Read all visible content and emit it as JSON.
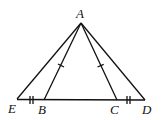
{
  "diagram": {
    "type": "geometry",
    "points": {
      "A": {
        "label": "A",
        "x": 81,
        "y": 23
      },
      "E": {
        "label": "E",
        "x": 17,
        "y": 99
      },
      "B": {
        "label": "B",
        "x": 44,
        "y": 100
      },
      "C": {
        "label": "C",
        "x": 117,
        "y": 100
      },
      "D": {
        "label": "D",
        "x": 145,
        "y": 100
      }
    },
    "segments": [
      "AE",
      "AB",
      "AC",
      "AD",
      "ED"
    ],
    "tick_marks": [
      {
        "segment": "AB",
        "count": 1
      },
      {
        "segment": "AC",
        "count": 1
      },
      {
        "segment": "EB",
        "count": 2
      },
      {
        "segment": "CD",
        "count": 2
      }
    ]
  }
}
